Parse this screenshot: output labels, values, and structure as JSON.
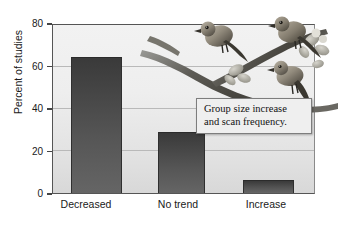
{
  "chart_data": {
    "type": "bar",
    "title": "",
    "xlabel": "",
    "ylabel": "Percent of studies",
    "categories": [
      "Decreased",
      "No trend",
      "Increase"
    ],
    "values": [
      65,
      29,
      6
    ],
    "ylim": [
      0,
      80
    ],
    "yticks": [
      0,
      20,
      40,
      60,
      80
    ],
    "ytick_labels": [
      "0",
      "20",
      "40",
      "60",
      "80"
    ],
    "grid": true,
    "legend": "none",
    "annotations": [
      {
        "name": "callout",
        "line1": "Group size increase",
        "line2": "and scan frequency."
      }
    ],
    "illustration": "three small birds perched on a flowering branch",
    "colors": {
      "bar_fill_top": "#3a3a3a",
      "bar_fill_bottom": "#656565",
      "plot_background": "#ebebeb",
      "gridline": "#b9b9b9",
      "axis": "#555555",
      "callout_background": "#efefef",
      "callout_border": "#7d7d7d",
      "text": "#1a1a1a"
    }
  }
}
